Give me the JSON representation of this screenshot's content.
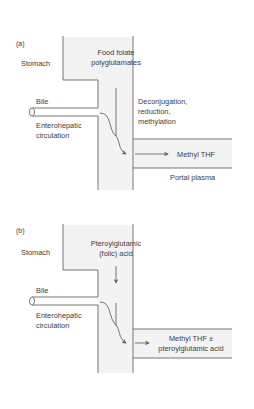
{
  "panels": [
    {
      "tag": "(a)",
      "stomach": "Stomach",
      "source_line1": "Food folate",
      "source_line2": "polyglutamates",
      "bile": "Bile",
      "entero_line1": "Enterohepatic",
      "entero_line2": "circulation",
      "process_line1": "Deconjugation,",
      "process_line2": "reduction,",
      "process_line3": "methylation",
      "product_line1": "Methyl THF",
      "portal": "Portal plasma"
    },
    {
      "tag": "(b)",
      "stomach": "Stomach",
      "source_line1": "Pteroylglutamic",
      "source_line2": "(folic) acid",
      "bile": "Bile",
      "entero_line1": "Enterohepatic",
      "entero_line2": "circulation",
      "product_line1": "Methyl THF ±",
      "product_line2": "pteroylglutamic acid"
    }
  ],
  "colors": {
    "line": "#555555",
    "fill": "#f2f2f2",
    "text": "#3c3c3c"
  }
}
